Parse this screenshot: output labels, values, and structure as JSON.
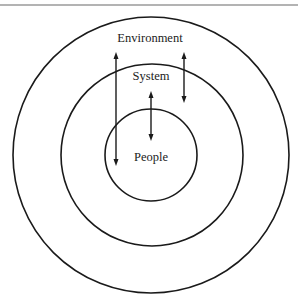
{
  "diagram": {
    "type": "concentric-circles",
    "labels": {
      "environment": "Environment",
      "system": "System",
      "people": "People"
    },
    "rings": [
      {
        "name": "environment",
        "cx": 151,
        "cy": 155,
        "r": 138
      },
      {
        "name": "system",
        "cx": 152,
        "cy": 155,
        "r": 91
      },
      {
        "name": "people",
        "cx": 151,
        "cy": 155,
        "r": 46
      }
    ],
    "arrows": [
      {
        "name": "environment-people",
        "x": 116,
        "y1": 52,
        "y2": 166,
        "bidirectional": true
      },
      {
        "name": "system-people",
        "x": 151,
        "y1": 91,
        "y2": 141,
        "bidirectional": true
      },
      {
        "name": "environment-system",
        "x": 184,
        "y1": 52,
        "y2": 103,
        "bidirectional": true
      }
    ],
    "colors": {
      "stroke": "#1a1a1a",
      "background": "#ffffff",
      "top_rule": "#9a9a9a"
    }
  }
}
